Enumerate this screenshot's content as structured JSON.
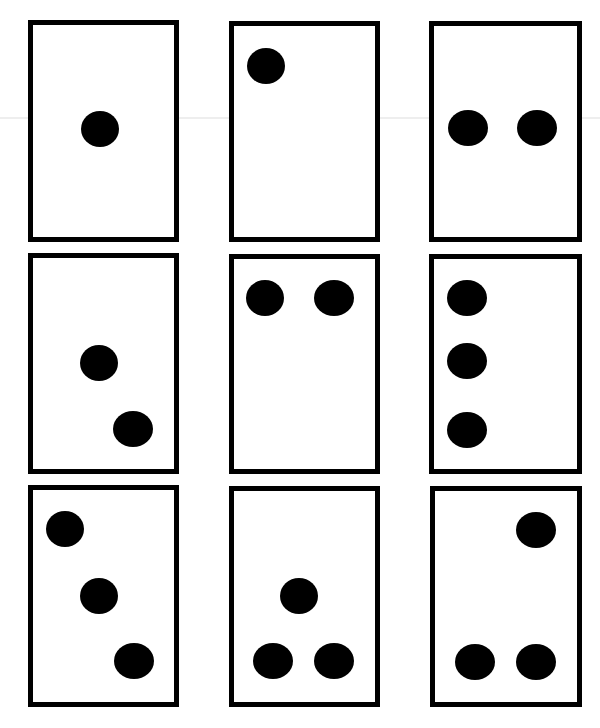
{
  "puzzle": {
    "grid": {
      "rows": 3,
      "cols": 3
    },
    "colors": {
      "background": "#ffffff",
      "border": "#000000",
      "dot": "#000000"
    },
    "cards": [
      {
        "id": 1,
        "row": 1,
        "col": 1,
        "x": 28,
        "y": 20,
        "w": 151,
        "h": 222,
        "dot_count": 1,
        "dots": [
          {
            "cx": 100,
            "cy": 129,
            "rx": 19,
            "ry": 18
          }
        ]
      },
      {
        "id": 2,
        "row": 1,
        "col": 2,
        "x": 229,
        "y": 21,
        "w": 151,
        "h": 221,
        "dot_count": 1,
        "dots": [
          {
            "cx": 266,
            "cy": 66,
            "rx": 19,
            "ry": 18
          }
        ]
      },
      {
        "id": 3,
        "row": 1,
        "col": 3,
        "x": 429,
        "y": 21,
        "w": 153,
        "h": 221,
        "dot_count": 2,
        "dots": [
          {
            "cx": 468,
            "cy": 128,
            "rx": 20,
            "ry": 18
          },
          {
            "cx": 537,
            "cy": 128,
            "rx": 20,
            "ry": 18
          }
        ]
      },
      {
        "id": 4,
        "row": 2,
        "col": 1,
        "x": 28,
        "y": 253,
        "w": 151,
        "h": 221,
        "dot_count": 2,
        "dots": [
          {
            "cx": 99,
            "cy": 363,
            "rx": 19,
            "ry": 18
          },
          {
            "cx": 133,
            "cy": 429,
            "rx": 20,
            "ry": 18
          }
        ]
      },
      {
        "id": 5,
        "row": 2,
        "col": 2,
        "x": 229,
        "y": 254,
        "w": 151,
        "h": 220,
        "dot_count": 2,
        "dots": [
          {
            "cx": 265,
            "cy": 298,
            "rx": 19,
            "ry": 18
          },
          {
            "cx": 334,
            "cy": 298,
            "rx": 20,
            "ry": 18
          }
        ]
      },
      {
        "id": 6,
        "row": 2,
        "col": 3,
        "x": 429,
        "y": 254,
        "w": 153,
        "h": 220,
        "dot_count": 3,
        "dots": [
          {
            "cx": 467,
            "cy": 298,
            "rx": 20,
            "ry": 18
          },
          {
            "cx": 467,
            "cy": 361,
            "rx": 20,
            "ry": 18
          },
          {
            "cx": 467,
            "cy": 430,
            "rx": 20,
            "ry": 18
          }
        ]
      },
      {
        "id": 7,
        "row": 3,
        "col": 1,
        "x": 28,
        "y": 485,
        "w": 151,
        "h": 222,
        "dot_count": 3,
        "dots": [
          {
            "cx": 65,
            "cy": 529,
            "rx": 19,
            "ry": 18
          },
          {
            "cx": 99,
            "cy": 596,
            "rx": 19,
            "ry": 18
          },
          {
            "cx": 134,
            "cy": 661,
            "rx": 20,
            "ry": 18
          }
        ]
      },
      {
        "id": 8,
        "row": 3,
        "col": 2,
        "x": 229,
        "y": 486,
        "w": 151,
        "h": 221,
        "dot_count": 3,
        "dots": [
          {
            "cx": 299,
            "cy": 596,
            "rx": 19,
            "ry": 18
          },
          {
            "cx": 273,
            "cy": 661,
            "rx": 20,
            "ry": 18
          },
          {
            "cx": 334,
            "cy": 661,
            "rx": 20,
            "ry": 18
          }
        ]
      },
      {
        "id": 9,
        "row": 3,
        "col": 3,
        "x": 430,
        "y": 486,
        "w": 152,
        "h": 221,
        "dot_count": 3,
        "dots": [
          {
            "cx": 536,
            "cy": 530,
            "rx": 20,
            "ry": 18
          },
          {
            "cx": 475,
            "cy": 662,
            "rx": 20,
            "ry": 18
          },
          {
            "cx": 536,
            "cy": 662,
            "rx": 20,
            "ry": 18
          }
        ]
      }
    ]
  }
}
